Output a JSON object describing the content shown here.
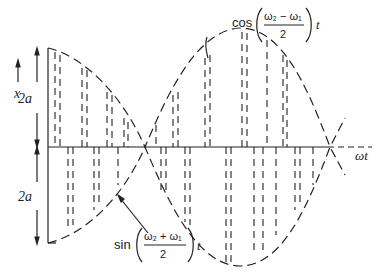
{
  "diagram": {
    "axis": {
      "vertical_label": "x",
      "horizontal_label": "ωt"
    },
    "dimensions": {
      "upper_amplitude": "2a",
      "lower_amplitude": "2a"
    },
    "labels": {
      "envelope": {
        "func": "cos",
        "numerator": "ω₂ − ω₁",
        "denominator": "2",
        "var": "t"
      },
      "carrier": {
        "func": "sin",
        "numerator": "ω₂ + ω₁",
        "denominator": "2",
        "var": "t"
      }
    },
    "colors": {
      "ink": "#222222",
      "background": "#ffffff"
    }
  }
}
